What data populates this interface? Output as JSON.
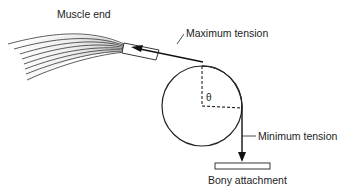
{
  "diagram": {
    "labels": {
      "muscle_end": "Muscle end",
      "maximum_tension": "Maximum tension",
      "minimum_tension": "Minimum tension",
      "bony_attachment": "Bony attachment",
      "theta": "θ"
    },
    "colors": {
      "stroke": "#1a1a1a",
      "shaded_region": "#8c8c8c",
      "background": "#ffffff"
    }
  }
}
